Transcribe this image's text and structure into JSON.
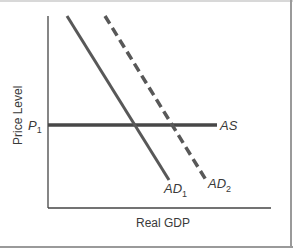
{
  "chart_data": {
    "type": "line",
    "title": "",
    "xlabel": "Real GDP",
    "ylabel": "Price Level",
    "y_tick_labels": [
      {
        "label": "P",
        "subscript": "1",
        "y": 125
      }
    ],
    "series": [
      {
        "name": "AS",
        "label": "AS",
        "style": "solid",
        "color": "#474747",
        "points": [
          [
            48,
            125
          ],
          [
            217,
            125
          ]
        ]
      },
      {
        "name": "AD1",
        "label": "AD",
        "subscript": "1",
        "style": "solid",
        "color": "#585858",
        "points": [
          [
            67,
            16
          ],
          [
            169,
            180
          ]
        ]
      },
      {
        "name": "AD2",
        "label": "AD",
        "subscript": "2",
        "style": "dashed",
        "color": "#585858",
        "points": [
          [
            105,
            16
          ],
          [
            206,
            180
          ]
        ]
      }
    ],
    "axes": {
      "origin": [
        48,
        208
      ],
      "x_end": 271,
      "y_top": 16
    },
    "grid": false,
    "legend": "none"
  }
}
